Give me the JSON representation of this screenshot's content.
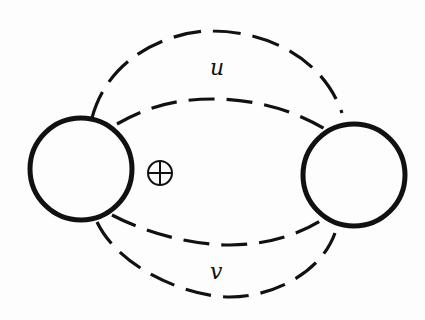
{
  "diagram": {
    "labels": {
      "top": "u",
      "bottom": "v"
    },
    "symbols": {
      "direct_sum": "oplus-symbol"
    },
    "nodes": [
      {
        "id": "left-node",
        "cx": 81,
        "cy": 169,
        "r": 51
      },
      {
        "id": "right-node",
        "cx": 354,
        "cy": 175,
        "r": 51
      }
    ],
    "colors": {
      "stroke": "#111111",
      "background": "#fdfdfd"
    }
  }
}
